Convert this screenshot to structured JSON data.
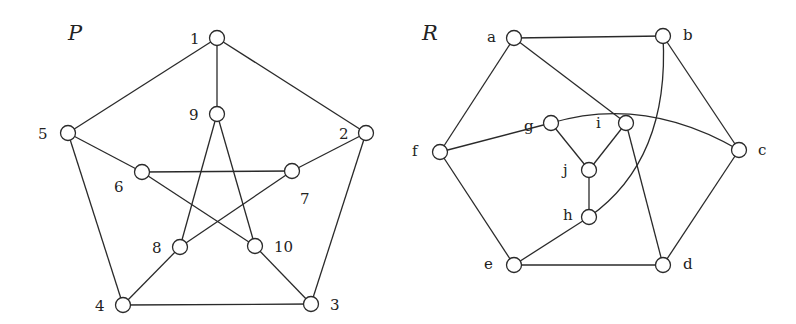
{
  "graphs": [
    {
      "id": "P",
      "title": "P",
      "title_pos": [
        68,
        40
      ],
      "nodes": [
        {
          "id": "1",
          "label": "1",
          "x": 217,
          "y": 38,
          "lx": 190,
          "ly": 39
        },
        {
          "id": "2",
          "label": "2",
          "x": 366,
          "y": 133,
          "lx": 339,
          "ly": 134
        },
        {
          "id": "3",
          "label": "3",
          "x": 311,
          "y": 304,
          "lx": 330,
          "ly": 305
        },
        {
          "id": "4",
          "label": "4",
          "x": 123,
          "y": 305,
          "lx": 95,
          "ly": 306
        },
        {
          "id": "5",
          "label": "5",
          "x": 68,
          "y": 133,
          "lx": 38,
          "ly": 134
        },
        {
          "id": "6",
          "label": "6",
          "x": 142,
          "y": 172,
          "lx": 114,
          "ly": 187
        },
        {
          "id": "7",
          "label": "7",
          "x": 292,
          "y": 171,
          "lx": 300,
          "ly": 199
        },
        {
          "id": "8",
          "label": "8",
          "x": 180,
          "y": 247,
          "lx": 152,
          "ly": 248
        },
        {
          "id": "9",
          "label": "9",
          "x": 217,
          "y": 114,
          "lx": 189,
          "ly": 115
        },
        {
          "id": "10",
          "label": "10",
          "x": 255,
          "y": 246,
          "lx": 274,
          "ly": 247
        }
      ],
      "edges": [
        [
          "1",
          "2"
        ],
        [
          "2",
          "3"
        ],
        [
          "3",
          "4"
        ],
        [
          "4",
          "5"
        ],
        [
          "5",
          "1"
        ],
        [
          "1",
          "9"
        ],
        [
          "2",
          "7"
        ],
        [
          "3",
          "10"
        ],
        [
          "4",
          "8"
        ],
        [
          "5",
          "6"
        ],
        [
          "6",
          "7"
        ],
        [
          "6",
          "10"
        ],
        [
          "7",
          "8"
        ],
        [
          "8",
          "9"
        ],
        [
          "9",
          "10"
        ]
      ],
      "arcs": []
    },
    {
      "id": "R",
      "title": "R",
      "title_pos": [
        422,
        40
      ],
      "nodes": [
        {
          "id": "a",
          "label": "a",
          "x": 514,
          "y": 38,
          "lx": 487,
          "ly": 37
        },
        {
          "id": "b",
          "label": "b",
          "x": 663,
          "y": 36,
          "lx": 683,
          "ly": 35
        },
        {
          "id": "c",
          "label": "c",
          "x": 739,
          "y": 150,
          "lx": 758,
          "ly": 150
        },
        {
          "id": "d",
          "label": "d",
          "x": 663,
          "y": 265,
          "lx": 683,
          "ly": 264
        },
        {
          "id": "e",
          "label": "e",
          "x": 514,
          "y": 265,
          "lx": 484,
          "ly": 264
        },
        {
          "id": "f",
          "label": "f",
          "x": 440,
          "y": 152,
          "lx": 412,
          "ly": 151
        },
        {
          "id": "g",
          "label": "g",
          "x": 551,
          "y": 123,
          "lx": 524,
          "ly": 126
        },
        {
          "id": "h",
          "label": "h",
          "x": 589,
          "y": 217,
          "lx": 563,
          "ly": 215
        },
        {
          "id": "i",
          "label": "i",
          "x": 626,
          "y": 123,
          "lx": 596,
          "ly": 123
        },
        {
          "id": "j",
          "label": "j",
          "x": 589,
          "y": 170,
          "lx": 563,
          "ly": 170
        }
      ],
      "edges": [
        [
          "a",
          "b"
        ],
        [
          "a",
          "f"
        ],
        [
          "a",
          "i"
        ],
        [
          "b",
          "c"
        ],
        [
          "c",
          "d"
        ],
        [
          "d",
          "e"
        ],
        [
          "e",
          "f"
        ],
        [
          "f",
          "g"
        ],
        [
          "g",
          "j"
        ],
        [
          "i",
          "j"
        ],
        [
          "j",
          "h"
        ],
        [
          "e",
          "h"
        ],
        [
          "i",
          "d"
        ]
      ],
      "arcs": [
        {
          "from": "g",
          "to": "c",
          "path": "M551,123 Q645,95 739,150"
        },
        {
          "from": "b",
          "to": "h",
          "path": "M663,36 Q670,160 589,217"
        }
      ]
    }
  ]
}
